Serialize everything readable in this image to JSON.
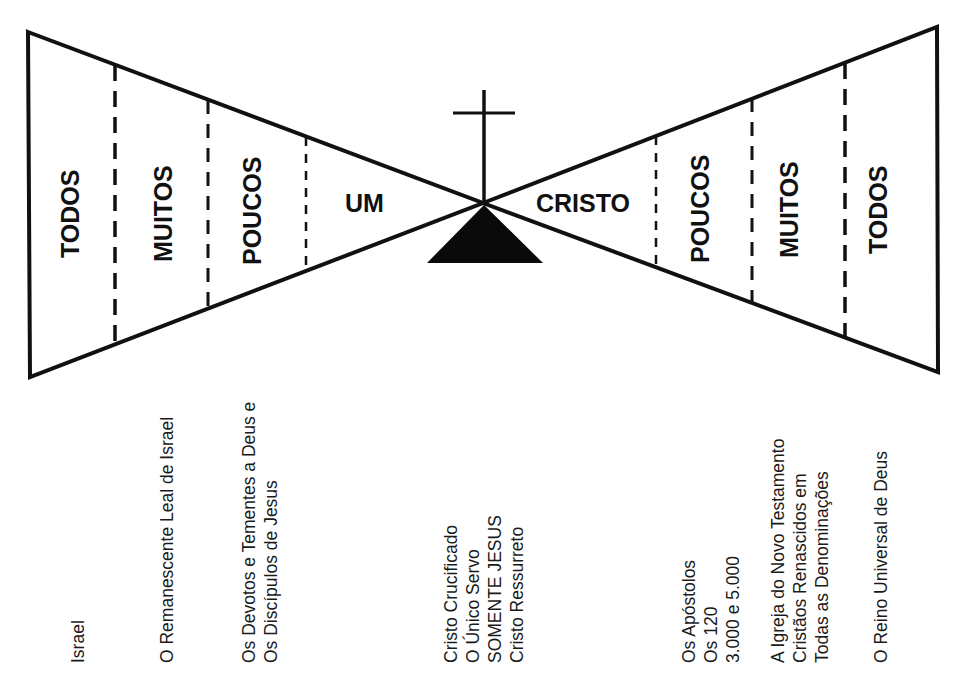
{
  "diagram": {
    "colors": {
      "stroke": "#111111",
      "background": "#ffffff"
    },
    "left_funnel": {
      "segments": [
        {
          "label": "TODOS"
        },
        {
          "label": "MUITOS"
        },
        {
          "label": "POUCOS"
        },
        {
          "label": "UM"
        }
      ]
    },
    "center": {
      "icon": "cross-on-hill-icon"
    },
    "right_funnel": {
      "segments": [
        {
          "label": "CRISTO"
        },
        {
          "label": "POUCOS"
        },
        {
          "label": "MUITOS"
        },
        {
          "label": "TODOS"
        }
      ]
    },
    "captions": [
      {
        "lines": [
          "Israel"
        ]
      },
      {
        "lines": [
          "O Remanescente Leal de Israel"
        ]
      },
      {
        "lines": [
          "Os Devotos e Tementes a Deus e",
          "Os Discípulos de Jesus"
        ]
      },
      {
        "lines": [
          "Cristo Crucificado",
          "O Único Servo",
          "SOMENTE JESUS",
          "Cristo Ressurreto"
        ]
      },
      {
        "lines": [
          "Os Apóstolos",
          "Os 120",
          "3.000 e 5.000"
        ]
      },
      {
        "lines": [
          "A Igreja do Novo Testamento",
          "Cristãos Renascidos em",
          "Todas as Denominações"
        ]
      },
      {
        "lines": [
          "O Reino Universal de Deus"
        ]
      }
    ]
  }
}
